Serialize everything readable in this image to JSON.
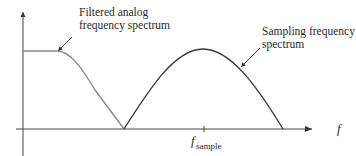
{
  "diagram": {
    "labels": {
      "filtered_line1": "Filtered analog",
      "filtered_line2": "frequency spectrum",
      "sampling_line1": "Sampling frequency",
      "sampling_line2": "spectrum",
      "x_axis": "f",
      "tick_main": "f",
      "tick_sub": "sample"
    },
    "colors": {
      "filtered_curve": "#8a8a8a",
      "sampling_curve": "#3a3a3a",
      "axis": "#444444",
      "text": "#2a2a2a"
    }
  }
}
